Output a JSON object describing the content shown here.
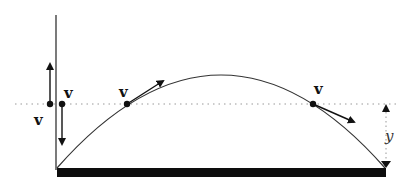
{
  "diagram": {
    "colors": {
      "ink": "#111111",
      "curve": "#333333",
      "dotted": "#999999",
      "background": "#ffffff"
    },
    "labels": {
      "v_vertical_up_right": "v",
      "v_vertical_left": "v",
      "v_rising": "v",
      "v_falling": "v",
      "height": "y"
    },
    "elements": {
      "ground": "ground-bar",
      "vertical_axis": "vertical-line",
      "reference_height": "dotted-horizontal-line",
      "trajectory": "parabolic-path"
    }
  }
}
